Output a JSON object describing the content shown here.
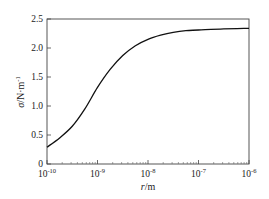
{
  "chart_data": {
    "type": "line",
    "title": "",
    "xlabel_italic": "r",
    "xlabel_unit": "/m",
    "ylabel_italic": "σ",
    "ylabel_unit": "/N·m",
    "ylabel_exp": "-1",
    "xscale": "log",
    "xlim": [
      1e-10,
      1e-06
    ],
    "ylim": [
      0,
      2.5
    ],
    "grid": false,
    "x_ticks": [
      {
        "base": "10",
        "exp": "-10"
      },
      {
        "base": "10",
        "exp": "-9"
      },
      {
        "base": "10",
        "exp": "-8"
      },
      {
        "base": "10",
        "exp": "-7"
      },
      {
        "base": "10",
        "exp": "-6"
      }
    ],
    "y_ticks": [
      "0",
      "0.5",
      "1.0",
      "1.5",
      "2.0",
      "2.5"
    ],
    "y_tick_values": [
      0,
      0.5,
      1.0,
      1.5,
      2.0,
      2.5
    ],
    "series": [
      {
        "name": "sigma",
        "color": "#111111",
        "log10_x": [
          -10,
          -9.75,
          -9.5,
          -9.25,
          -9,
          -8.75,
          -8.5,
          -8.25,
          -8,
          -7.75,
          -7.5,
          -7.25,
          -7,
          -6.5,
          -6
        ],
        "y": [
          0.29,
          0.45,
          0.65,
          0.95,
          1.32,
          1.63,
          1.87,
          2.04,
          2.15,
          2.22,
          2.27,
          2.3,
          2.31,
          2.33,
          2.34
        ]
      }
    ]
  }
}
